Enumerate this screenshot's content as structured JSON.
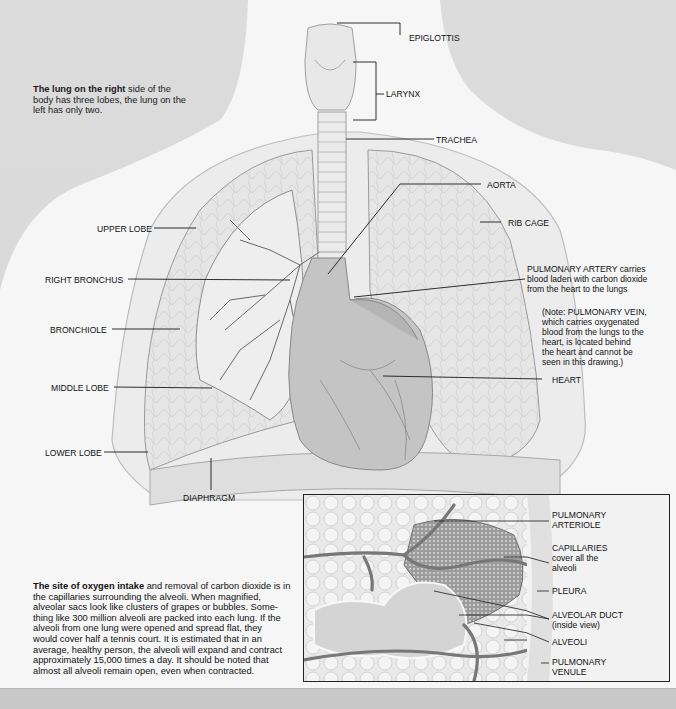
{
  "intro": {
    "bold": "The lung on the right",
    "text": " side of the body has three lobes, the lung on the left has only two."
  },
  "labels": {
    "epiglottis": "EPIGLOTTIS",
    "larynx": "LARYNX",
    "trachea": "TRACHEA",
    "aorta": "AORTA",
    "rib_cage": "RIB CAGE",
    "upper_lobe": "UPPER LOBE",
    "right_bronchus": "RIGHT BRONCHUS",
    "bronchiole": "BRONCHIOLE",
    "middle_lobe": "MIDDLE LOBE",
    "lower_lobe": "LOWER LOBE",
    "diaphragm": "DIAPHRAGM",
    "heart": "HEART",
    "pulmonary_artery": {
      "title": "PULMONARY ARTERY",
      "line1_rest": " carries",
      "line2": "blood laden with carbon dioxide",
      "line3": "from the heart to the lungs"
    },
    "note": {
      "line1": "(Note: PULMONARY VEIN,",
      "line2": "which carries oxygenated",
      "line3": "blood from the lungs to the",
      "line4": "heart, is located behind",
      "line5": "the heart and cannot be",
      "line6": "seen in this drawing.)"
    }
  },
  "inset": {
    "labels": {
      "pulmonary_arteriole_1": "PULMONARY",
      "pulmonary_arteriole_2": "ARTERIOLE",
      "capillaries_1": "CAPILLARIES",
      "capillaries_2": "cover all the",
      "capillaries_3": "alveoli",
      "pleura": "PLEURA",
      "alveolar_duct_1": "ALVEOLAR DUCT",
      "alveolar_duct_2": "(inside view)",
      "alveoli": "ALVEOLI",
      "pulmonary_venule_1": "PULMONARY",
      "pulmonary_venule_2": "VENULE"
    }
  },
  "body_text": {
    "bold": "The site of oxygen intake",
    "lines": [
      " and removal of carbon dioxide is in",
      "the capillaries surrounding the alveoli. When magnified,",
      "alveolar sacs look like clusters of grapes or bubbles. Some-",
      "thing like 300 million alveoli are packed into each lung. If the",
      "alveoli from one lung were opened and spread flat, they",
      "would cover half a tennis court. It is estimated that in an",
      "average, healthy person, the alveoli will expand and contract",
      "approximately 15,000 times a day. It should be noted that",
      "almost all alveoli remain open, even when contracted."
    ]
  },
  "colors": {
    "background": "#d9d9d9",
    "body": "#f6f6f6",
    "lung_fill": "#e4e4e4",
    "heart_fill": "#bdbdbd",
    "line": "#1a1a1a"
  }
}
